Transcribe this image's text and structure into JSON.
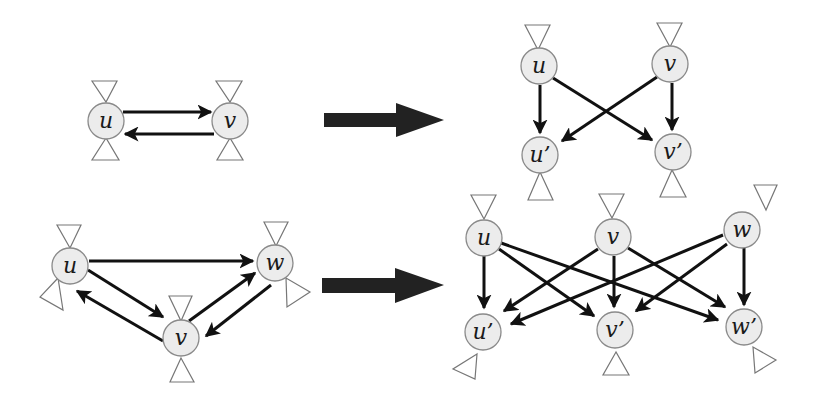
{
  "diagram": {
    "type": "graph-transformation",
    "colors": {
      "node_fill": "#ececec",
      "node_stroke": "#8a8a8a",
      "edge": "#111111",
      "transform_arrow": "#222222",
      "triangle_stroke": "#777777"
    },
    "rows": [
      {
        "name": "two-cycle",
        "left_graph": {
          "nodes": [
            {
              "id": "u",
              "label": "u"
            },
            {
              "id": "v",
              "label": "v"
            }
          ],
          "edges": [
            {
              "from": "u",
              "to": "v"
            },
            {
              "from": "v",
              "to": "u"
            }
          ]
        },
        "right_graph": {
          "nodes": [
            {
              "id": "u",
              "label": "u"
            },
            {
              "id": "v",
              "label": "v"
            },
            {
              "id": "u2",
              "label": "u’"
            },
            {
              "id": "v2",
              "label": "v’"
            }
          ],
          "edges": [
            {
              "from": "u",
              "to": "u’"
            },
            {
              "from": "u",
              "to": "v’"
            },
            {
              "from": "v",
              "to": "u’"
            },
            {
              "from": "v",
              "to": "v’"
            }
          ]
        }
      },
      {
        "name": "three-cycle",
        "left_graph": {
          "nodes": [
            {
              "id": "u",
              "label": "u"
            },
            {
              "id": "v",
              "label": "v"
            },
            {
              "id": "w",
              "label": "w"
            }
          ],
          "edges": [
            {
              "from": "u",
              "to": "w"
            },
            {
              "from": "u",
              "to": "v"
            },
            {
              "from": "v",
              "to": "u"
            },
            {
              "from": "v",
              "to": "w"
            },
            {
              "from": "w",
              "to": "v"
            }
          ]
        },
        "right_graph": {
          "nodes": [
            {
              "id": "u",
              "label": "u"
            },
            {
              "id": "v",
              "label": "v"
            },
            {
              "id": "w",
              "label": "w"
            },
            {
              "id": "u2",
              "label": "u’"
            },
            {
              "id": "v2",
              "label": "v’"
            },
            {
              "id": "w2",
              "label": "w’"
            }
          ],
          "edges": [
            {
              "from": "u",
              "to": "u’"
            },
            {
              "from": "u",
              "to": "v’"
            },
            {
              "from": "u",
              "to": "w’"
            },
            {
              "from": "v",
              "to": "u’"
            },
            {
              "from": "v",
              "to": "v’"
            },
            {
              "from": "v",
              "to": "w’"
            },
            {
              "from": "w",
              "to": "u’"
            },
            {
              "from": "w",
              "to": "v’"
            },
            {
              "from": "w",
              "to": "w’"
            }
          ]
        }
      }
    ]
  },
  "labels": {
    "r1_left_u": "u",
    "r1_left_v": "v",
    "r1_right_u": "u",
    "r1_right_v": "v",
    "r1_right_u2": "u’",
    "r1_right_v2": "v’",
    "r2_left_u": "u",
    "r2_left_v": "v",
    "r2_left_w": "w",
    "r2_right_u": "u",
    "r2_right_v": "v",
    "r2_right_w": "w",
    "r2_right_u2": "u’",
    "r2_right_v2": "v’",
    "r2_right_w2": "w’"
  }
}
